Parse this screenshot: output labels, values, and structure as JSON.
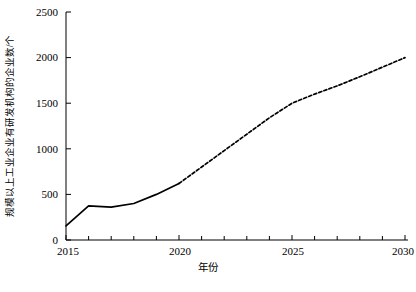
{
  "chart_data": {
    "type": "line",
    "title": "",
    "xlabel": "年份",
    "ylabel": "规模以上工业企业有研发机构的企业数/个",
    "xlim": [
      2015,
      2030
    ],
    "ylim": [
      0,
      2500
    ],
    "grid": false,
    "legend": null,
    "x_ticks": [
      2015,
      2020,
      2025,
      2030
    ],
    "x_tick_labels": [
      "2015",
      "2020",
      "2025",
      "2030"
    ],
    "x_minor_ticks": [
      2016,
      2017,
      2018,
      2019,
      2021,
      2022,
      2023,
      2024,
      2026,
      2027,
      2028,
      2029
    ],
    "y_ticks": [
      0,
      500,
      1000,
      1500,
      2000,
      2500
    ],
    "y_tick_labels": [
      "0",
      "500",
      "1000",
      "1500",
      "2000",
      "2500"
    ],
    "series": [
      {
        "name": "历史值",
        "style": "solid",
        "color": "#000000",
        "x": [
          2015,
          2016,
          2017,
          2018,
          2019,
          2020
        ],
        "values": [
          155,
          375,
          360,
          400,
          500,
          620
        ]
      },
      {
        "name": "预测值",
        "style": "dashed",
        "color": "#000000",
        "x": [
          2020,
          2021,
          2022,
          2023,
          2024,
          2025,
          2026,
          2027,
          2028,
          2029,
          2030
        ],
        "values": [
          620,
          800,
          980,
          1160,
          1340,
          1500,
          1600,
          1690,
          1790,
          1895,
          2000
        ]
      }
    ]
  },
  "axis": {
    "y_title": "规模以上工业企业有研发机构的企业数/个",
    "x_title": "年份",
    "y_labels": [
      "2500",
      "2000",
      "1500",
      "1000",
      "500",
      "0"
    ],
    "x_labels": [
      "2015",
      "2020",
      "2025",
      "2030"
    ]
  },
  "caption": {
    "text": ""
  }
}
